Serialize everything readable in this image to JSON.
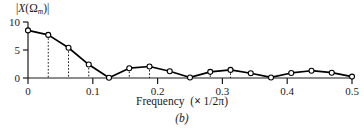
{
  "figure": {
    "caption": "(b)",
    "ylabel_prefix": "|",
    "ylabel_X": "X",
    "ylabel_open": "(Ω",
    "ylabel_sub": "m",
    "ylabel_close": ")|",
    "xtitle_main": "Frequency",
    "xtitle_paren_open": "(",
    "xtitle_times": "×",
    "xtitle_frac": "1/2",
    "xtitle_pi": "π",
    "xtitle_paren_close": ")"
  },
  "chart_data": {
    "type": "line",
    "title": "",
    "subtitle": "(b)",
    "xlabel": "Frequency  (× 1/2π)",
    "ylabel": "|X(Ωm)|",
    "xlim": [
      0,
      0.5
    ],
    "ylim": [
      0,
      10
    ],
    "xticks": [
      0,
      0.1,
      0.2,
      0.3,
      0.4,
      0.5
    ],
    "xticklabels": [
      "0",
      "0.1",
      "0.2",
      "0.3",
      "0.4",
      "0.5"
    ],
    "yticks": [
      0,
      5,
      10
    ],
    "yticklabels": [
      "0",
      "5",
      "10"
    ],
    "grid": false,
    "legend": null,
    "marker": "open-circle",
    "series": [
      {
        "name": "|X(Ωm)|",
        "x": [
          0.0,
          0.03125,
          0.0625,
          0.09375,
          0.125,
          0.15625,
          0.1875,
          0.21875,
          0.25,
          0.28125,
          0.3125,
          0.34375,
          0.375,
          0.40625,
          0.4375,
          0.46875,
          0.5
        ],
        "y": [
          8.5,
          7.7,
          5.4,
          2.4,
          0.05,
          1.75,
          2.05,
          1.2,
          0.1,
          1.1,
          1.45,
          0.85,
          0.1,
          0.9,
          1.3,
          0.95,
          0.25
        ]
      }
    ],
    "dropline_x": [
      0.03125,
      0.0625,
      0.09375,
      0.15625,
      0.1875,
      0.28125,
      0.3125
    ],
    "dropline_style": "dotted"
  }
}
